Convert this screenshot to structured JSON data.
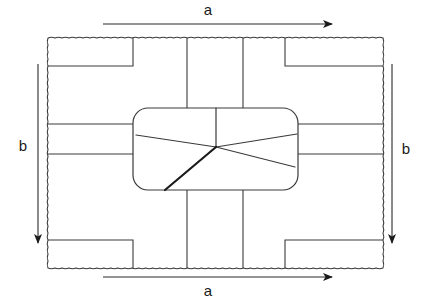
{
  "figure": {
    "type": "line-diagram",
    "background_color": "#ffffff",
    "line_color": "#3a3a3a",
    "heavy_line_color": "#1a1a1a",
    "label_color": "#1a1a1a",
    "canvas": {
      "width": 424,
      "height": 307
    }
  },
  "labels": {
    "top_dimension": "a",
    "bottom_dimension": "a",
    "left_dimension": "b",
    "right_dimension": "b"
  },
  "dimensions": {
    "top_arrow": {
      "x1": 103,
      "y1": 24,
      "x2": 332,
      "y2": 24,
      "direction": "right",
      "label": "a",
      "label_x": 208,
      "label_y": 11
    },
    "bottom_arrow": {
      "x1": 103,
      "y1": 277,
      "x2": 332,
      "y2": 277,
      "direction": "right",
      "label": "a",
      "label_x": 208,
      "label_y": 292
    },
    "left_arrow": {
      "x1": 38,
      "y1": 64,
      "x2": 38,
      "y2": 243,
      "direction": "down",
      "label": "b",
      "label_x": 23,
      "label_y": 147
    },
    "right_arrow": {
      "x1": 392,
      "y1": 64,
      "x2": 392,
      "y2": 243,
      "direction": "down",
      "label": "b",
      "label_x": 406,
      "label_y": 150
    }
  },
  "outer_boundary": {
    "style": "wavy-dashed",
    "x": 48,
    "y": 38,
    "width": 335,
    "height": 230
  },
  "corner_blocks": [
    {
      "name": "top-left-block",
      "x1": 48,
      "y1": 38,
      "x2": 133,
      "y2": 66
    },
    {
      "name": "top-right-block",
      "x1": 285,
      "y1": 38,
      "x2": 383,
      "y2": 66
    },
    {
      "name": "bottom-left-block",
      "x1": 48,
      "y1": 240,
      "x2": 133,
      "y2": 268
    },
    {
      "name": "bottom-right-block",
      "x1": 285,
      "y1": 240,
      "x2": 383,
      "y2": 268
    }
  ],
  "vertical_channels": [
    {
      "name": "channel-left-upper",
      "x": 187,
      "y1": 38,
      "y2": 108
    },
    {
      "name": "channel-right-upper",
      "x": 243,
      "y1": 38,
      "y2": 108
    },
    {
      "name": "channel-left-lower",
      "x": 187,
      "y1": 190,
      "y2": 268
    },
    {
      "name": "channel-right-lower",
      "x": 243,
      "y1": 190,
      "y2": 268
    }
  ],
  "horizontal_channels": [
    {
      "name": "channel-left-top",
      "x1": 48,
      "y": 124,
      "x2": 133
    },
    {
      "name": "channel-left-bottom",
      "x1": 48,
      "y": 154,
      "x2": 133
    },
    {
      "name": "channel-right-top",
      "x1": 298,
      "y": 124,
      "x2": 383
    },
    {
      "name": "channel-right-bottom",
      "x1": 298,
      "y": 154,
      "x2": 383
    }
  ],
  "central_island": {
    "name": "rounded-island",
    "x": 133,
    "y": 108,
    "width": 165,
    "height": 82,
    "radius": 15
  },
  "radiating_lines": {
    "hub": {
      "x": 216,
      "y": 147
    },
    "spokes": [
      {
        "name": "spoke-up",
        "x": 216,
        "y": 108,
        "weight": "thin"
      },
      {
        "name": "spoke-left",
        "x": 136,
        "y": 135,
        "weight": "thin"
      },
      {
        "name": "spoke-right-upper",
        "x": 297,
        "y": 134,
        "weight": "thin"
      },
      {
        "name": "spoke-right-lower",
        "x": 295,
        "y": 167,
        "weight": "thin"
      },
      {
        "name": "spoke-down-left",
        "x": 165,
        "y": 190,
        "weight": "heavy"
      }
    ]
  }
}
